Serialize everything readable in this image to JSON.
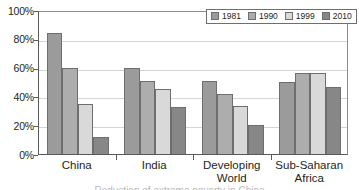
{
  "chart_data": {
    "type": "bar",
    "title": "",
    "xlabel": "",
    "ylabel": "",
    "ylim": [
      0,
      100
    ],
    "yticks": [
      0,
      20,
      40,
      60,
      80,
      100
    ],
    "ytick_labels": [
      "0%",
      "20%",
      "40%",
      "60%",
      "80%",
      "100%"
    ],
    "grid": true,
    "legend_position": "upper right",
    "categories": [
      "China",
      "India",
      "Developing World",
      "Sub-Saharan Africa"
    ],
    "category_labels": [
      [
        "China"
      ],
      [
        "India"
      ],
      [
        "Developing",
        "World"
      ],
      [
        "Sub-Saharan",
        "Africa"
      ]
    ],
    "series": [
      {
        "name": "1981",
        "color": "#9b9b9b",
        "values": [
          84,
          60,
          51,
          50
        ]
      },
      {
        "name": "1990",
        "color": "#adadad",
        "values": [
          60,
          50.5,
          42,
          56
        ]
      },
      {
        "name": "1999",
        "color": "#d9d9d9",
        "values": [
          35,
          45,
          33,
          56.5
        ]
      },
      {
        "name": "2010",
        "color": "#878787",
        "values": [
          12,
          32.5,
          20,
          46.5
        ]
      }
    ]
  },
  "legend": {
    "entries": [
      {
        "label": "1981"
      },
      {
        "label": "1990"
      },
      {
        "label": "1999"
      },
      {
        "label": "2010"
      }
    ]
  },
  "caption": {
    "text": "Reduction of extreme poverty in China"
  }
}
